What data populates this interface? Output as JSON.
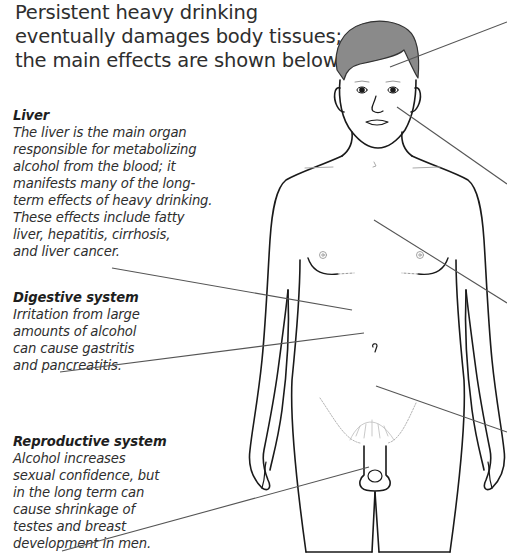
{
  "intro": {
    "text": "Persistent heavy drinking eventually damages body tissues; the main effects are shown below."
  },
  "callouts": [
    {
      "id": "liver",
      "heading": "Liver",
      "body": "The liver is the main organ\nresponsible for metabolizing\nalcohol from the blood; it\nmanifests many of the long-\nterm effects of heavy drinking.\nThese effects include fatty\nliver, hepatitis, cirrhosis,\nand liver cancer."
    },
    {
      "id": "digestive",
      "heading": "Digestive system",
      "body": "Irritation from large\namounts of alcohol\ncan cause gastritis\nand pancreatitis."
    },
    {
      "id": "reproductive",
      "heading": "Reproductive system",
      "body": "Alcohol increases\nsexual confidence, but\nin the long term can\ncause shrinkage of\ntestes and breast\ndevelopment in men."
    }
  ],
  "figure": {
    "line_color": "#1a1a1a",
    "leader_color": "#555555",
    "hair_color": "#8a8a8a"
  }
}
